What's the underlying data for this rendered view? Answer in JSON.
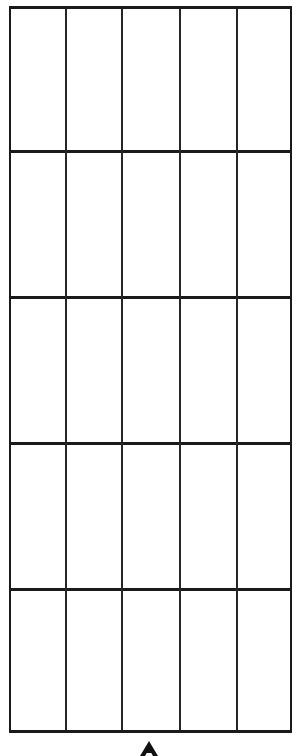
{
  "diagram": {
    "type": "grid",
    "rows": 5,
    "columns": 5,
    "line_color": "#1a1a1a",
    "background": "#ffffff",
    "cells_empty": true,
    "row_boundaries_px": [
      6,
      151,
      297,
      443,
      589,
      733
    ],
    "column_boundaries_px": [
      9,
      65,
      121,
      179,
      236,
      292
    ]
  },
  "marker": {
    "icon": "up-arrow-icon",
    "position": "bottom-center",
    "color": "#111111"
  }
}
